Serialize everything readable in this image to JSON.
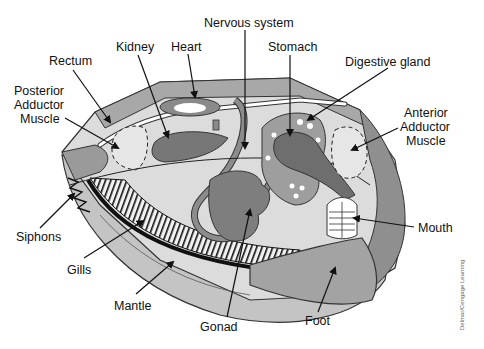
{
  "diagram": {
    "labels": [
      {
        "id": "nervous-system",
        "text": "Nervous system"
      },
      {
        "id": "kidney",
        "text": "Kidney"
      },
      {
        "id": "heart",
        "text": "Heart"
      },
      {
        "id": "stomach",
        "text": "Stomach"
      },
      {
        "id": "rectum",
        "text": "Rectum"
      },
      {
        "id": "digestive-gland",
        "text": "Digestive gland"
      },
      {
        "id": "posterior-adductor-line1",
        "text": "Posterior"
      },
      {
        "id": "posterior-adductor-line2",
        "text": "Adductor"
      },
      {
        "id": "posterior-adductor-line3",
        "text": "Muscle"
      },
      {
        "id": "anterior-adductor-line1",
        "text": "Anterior"
      },
      {
        "id": "anterior-adductor-line2",
        "text": "Adductor"
      },
      {
        "id": "anterior-adductor-line3",
        "text": "Muscle"
      },
      {
        "id": "siphons",
        "text": "Siphons"
      },
      {
        "id": "gills",
        "text": "Gills"
      },
      {
        "id": "mantle",
        "text": "Mantle"
      },
      {
        "id": "gonad",
        "text": "Gonad"
      },
      {
        "id": "foot",
        "text": "Foot"
      },
      {
        "id": "mouth",
        "text": "Mouth"
      }
    ],
    "credit": "Delmar/Cengage Learning"
  }
}
